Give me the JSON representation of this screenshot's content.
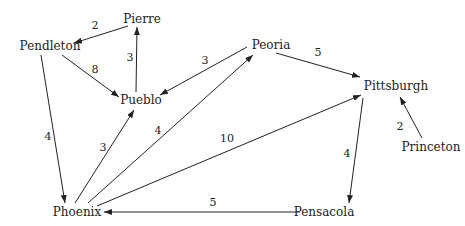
{
  "diagram": {
    "type": "directed-weighted-graph",
    "nodes": [
      {
        "id": "pierre",
        "label": "Pierre",
        "x": 142,
        "y": 19
      },
      {
        "id": "pendleton",
        "label": "Pendleton",
        "x": 50,
        "y": 46
      },
      {
        "id": "pueblo",
        "label": "Pueblo",
        "x": 141,
        "y": 100
      },
      {
        "id": "peoria",
        "label": "Peoria",
        "x": 271,
        "y": 45
      },
      {
        "id": "pittsburgh",
        "label": "Pittsburgh",
        "x": 396,
        "y": 86
      },
      {
        "id": "princeton",
        "label": "Princeton",
        "x": 431,
        "y": 147
      },
      {
        "id": "phoenix",
        "label": "Phoenix",
        "x": 77,
        "y": 212
      },
      {
        "id": "pensacola",
        "label": "Pensacola",
        "x": 324,
        "y": 212
      }
    ],
    "edges": [
      {
        "from": "pierre",
        "to": "pendleton",
        "weight": "2",
        "x1": 128,
        "y1": 26,
        "x2": 74,
        "y2": 43,
        "lx": 95,
        "ly": 29
      },
      {
        "from": "pendleton",
        "to": "pueblo",
        "weight": "8",
        "x1": 62,
        "y1": 55,
        "x2": 119,
        "y2": 97,
        "lx": 95,
        "ly": 73
      },
      {
        "from": "pueblo",
        "to": "pierre",
        "weight": "3",
        "x1": 136,
        "y1": 92,
        "x2": 137,
        "y2": 27,
        "lx": 130,
        "ly": 61
      },
      {
        "from": "peoria",
        "to": "pueblo",
        "weight": "3",
        "x1": 247,
        "y1": 47,
        "x2": 160,
        "y2": 95,
        "lx": 205,
        "ly": 64
      },
      {
        "from": "peoria",
        "to": "pittsburgh",
        "weight": "5",
        "x1": 276,
        "y1": 53,
        "x2": 360,
        "y2": 77,
        "lx": 318,
        "ly": 56
      },
      {
        "from": "pendleton",
        "to": "phoenix",
        "weight": "4",
        "x1": 41,
        "y1": 55,
        "x2": 65,
        "y2": 203,
        "lx": 48,
        "ly": 140
      },
      {
        "from": "phoenix",
        "to": "pueblo",
        "weight": "3",
        "x1": 75,
        "y1": 203,
        "x2": 134,
        "y2": 110,
        "lx": 103,
        "ly": 151
      },
      {
        "from": "phoenix",
        "to": "peoria",
        "weight": "4",
        "x1": 88,
        "y1": 203,
        "x2": 253,
        "y2": 55,
        "lx": 158,
        "ly": 134
      },
      {
        "from": "phoenix",
        "to": "pittsburgh",
        "weight": "10",
        "x1": 97,
        "y1": 206,
        "x2": 361,
        "y2": 95,
        "lx": 227,
        "ly": 142
      },
      {
        "from": "princeton",
        "to": "pittsburgh",
        "weight": "2",
        "x1": 422,
        "y1": 138,
        "x2": 400,
        "y2": 97,
        "lx": 400,
        "ly": 130
      },
      {
        "from": "pittsburgh",
        "to": "pensacola",
        "weight": "4",
        "x1": 363,
        "y1": 98,
        "x2": 349,
        "y2": 203,
        "lx": 347,
        "ly": 157
      },
      {
        "from": "pensacola",
        "to": "phoenix",
        "weight": "5",
        "x1": 300,
        "y1": 212,
        "x2": 104,
        "y2": 212,
        "lx": 213,
        "ly": 206
      }
    ]
  }
}
